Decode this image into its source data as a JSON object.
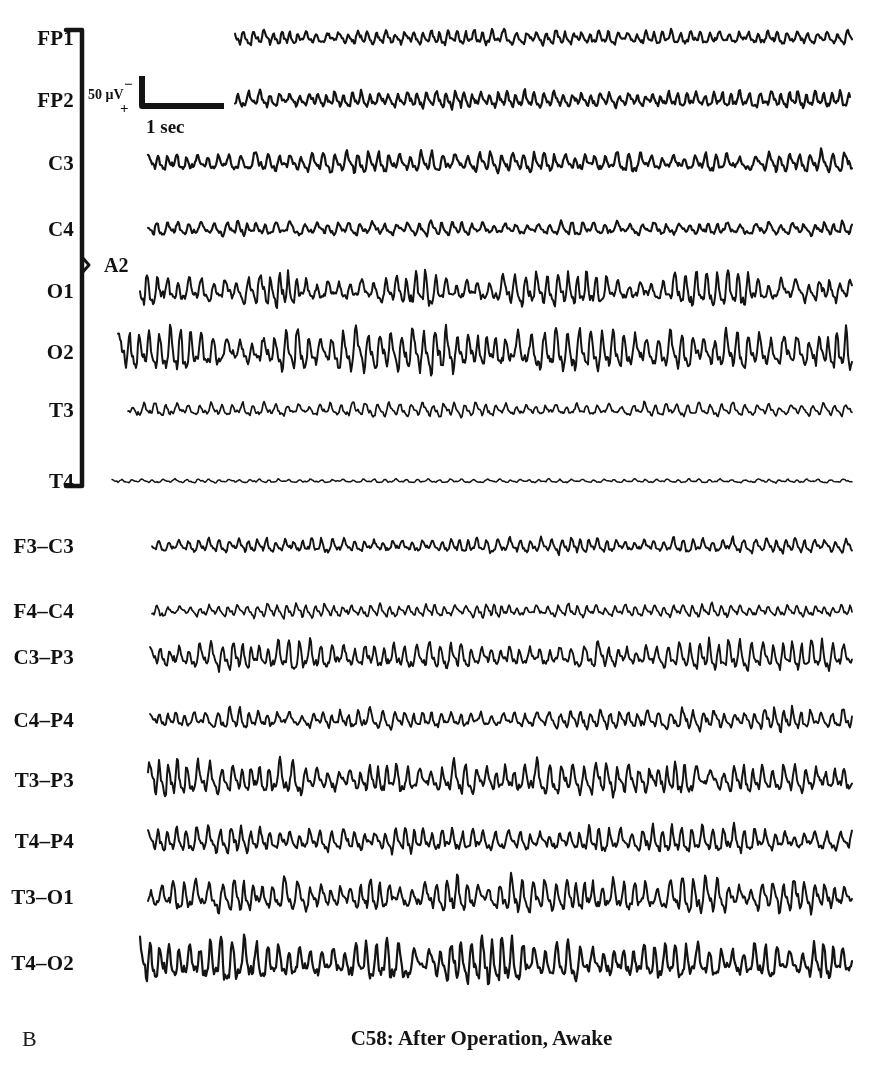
{
  "figure": {
    "panel_letter": "B",
    "caption": "C58: After Operation, Awake",
    "background_color": "#ffffff",
    "trace_color": "#141414"
  },
  "calibration": {
    "amplitude_label": "50 μV",
    "polarity_negative": "−",
    "polarity_positive": "+",
    "time_label": "1 sec",
    "amplitude_value": 50,
    "amplitude_units": "μV",
    "time_value": 1,
    "time_units": "sec"
  },
  "reference": {
    "label": "A2",
    "bracket_top_channel": "FP1",
    "bracket_bottom_channel": "T4"
  },
  "montages": [
    {
      "name": "referential",
      "reference": "A2",
      "channels": [
        {
          "label": "FP1",
          "y": 38,
          "x_start": 235,
          "x_end": 852,
          "amplitude": 7.5,
          "base_freq": 10.5,
          "seed": 11,
          "burst": 0.28,
          "thickness": 2.1
        },
        {
          "label": "FP2",
          "y": 100,
          "x_start": 235,
          "x_end": 850,
          "amplitude": 8.0,
          "base_freq": 10.8,
          "seed": 23,
          "burst": 0.3,
          "thickness": 2.2
        },
        {
          "label": "C3",
          "y": 163,
          "x_start": 148,
          "x_end": 852,
          "amplitude": 9.0,
          "base_freq": 10.2,
          "seed": 37,
          "burst": 0.4,
          "thickness": 2.2
        },
        {
          "label": "C4",
          "y": 229,
          "x_start": 148,
          "x_end": 852,
          "amplitude": 7.0,
          "base_freq": 10.0,
          "seed": 41,
          "burst": 0.34,
          "thickness": 2.1
        },
        {
          "label": "O1",
          "y": 291,
          "x_start": 140,
          "x_end": 852,
          "amplitude": 12.0,
          "base_freq": 10.6,
          "seed": 59,
          "burst": 0.62,
          "thickness": 2.0
        },
        {
          "label": "O2",
          "y": 352,
          "x_start": 118,
          "x_end": 852,
          "amplitude": 14.0,
          "base_freq": 10.4,
          "seed": 67,
          "burst": 0.7,
          "thickness": 2.0
        },
        {
          "label": "T3",
          "y": 410,
          "x_start": 128,
          "x_end": 852,
          "amplitude": 6.5,
          "base_freq": 10.7,
          "seed": 73,
          "burst": 0.3,
          "thickness": 1.7
        },
        {
          "label": "T4",
          "y": 481,
          "x_start": 112,
          "x_end": 852,
          "amplitude": 2.2,
          "base_freq": 11.0,
          "seed": 83,
          "burst": 0.16,
          "thickness": 1.5
        }
      ]
    },
    {
      "name": "bipolar",
      "reference": "",
      "channels": [
        {
          "label": "F3–C3",
          "y": 546,
          "x_start": 152,
          "x_end": 852,
          "amplitude": 7.0,
          "base_freq": 11.5,
          "seed": 97,
          "burst": 0.34,
          "thickness": 1.9
        },
        {
          "label": "F4–C4",
          "y": 611,
          "x_start": 152,
          "x_end": 852,
          "amplitude": 6.5,
          "base_freq": 11.8,
          "seed": 103,
          "burst": 0.32,
          "thickness": 1.7
        },
        {
          "label": "C3–P3",
          "y": 657,
          "x_start": 150,
          "x_end": 852,
          "amplitude": 11.0,
          "base_freq": 10.8,
          "seed": 109,
          "burst": 0.58,
          "thickness": 1.9
        },
        {
          "label": "C4–P4",
          "y": 720,
          "x_start": 150,
          "x_end": 852,
          "amplitude": 9.0,
          "base_freq": 11.0,
          "seed": 127,
          "burst": 0.42,
          "thickness": 1.9
        },
        {
          "label": "T3–P3",
          "y": 780,
          "x_start": 148,
          "x_end": 852,
          "amplitude": 12.5,
          "base_freq": 10.6,
          "seed": 131,
          "burst": 0.6,
          "thickness": 2.0
        },
        {
          "label": "T4–P4",
          "y": 841,
          "x_start": 148,
          "x_end": 852,
          "amplitude": 10.0,
          "base_freq": 10.9,
          "seed": 149,
          "burst": 0.48,
          "thickness": 2.0
        },
        {
          "label": "T3–O1",
          "y": 897,
          "x_start": 148,
          "x_end": 852,
          "amplitude": 12.0,
          "base_freq": 10.5,
          "seed": 157,
          "burst": 0.62,
          "thickness": 2.0
        },
        {
          "label": "T4–O2",
          "y": 963,
          "x_start": 140,
          "x_end": 852,
          "amplitude": 14.0,
          "base_freq": 10.3,
          "seed": 163,
          "burst": 0.72,
          "thickness": 2.2
        }
      ]
    }
  ],
  "chart_data": {
    "type": "line",
    "title": "C58: After Operation, Awake",
    "subtitle": "B",
    "xlabel": "Time",
    "ylabel": "Channel",
    "grid": false,
    "legend": "none",
    "x_units": "sec",
    "y_units": "μV",
    "scale_bar": {
      "amplitude": 50,
      "amplitude_units": "μV",
      "time": 1,
      "time_units": "sec"
    },
    "categories": [
      "FP1",
      "FP2",
      "C3",
      "C4",
      "O1",
      "O2",
      "T3",
      "T4",
      "F3–C3",
      "F4–C4",
      "C3–P3",
      "C4–P4",
      "T3–P3",
      "T4–P4",
      "T3–O1",
      "T4–O2"
    ],
    "series": [
      {
        "name": "FP1",
        "montage": "referential",
        "reference": "A2",
        "peak_to_peak_uv": 20,
        "dominant_freq_hz": 10.5
      },
      {
        "name": "FP2",
        "montage": "referential",
        "reference": "A2",
        "peak_to_peak_uv": 22,
        "dominant_freq_hz": 10.8
      },
      {
        "name": "C3",
        "montage": "referential",
        "reference": "A2",
        "peak_to_peak_uv": 25,
        "dominant_freq_hz": 10.2
      },
      {
        "name": "C4",
        "montage": "referential",
        "reference": "A2",
        "peak_to_peak_uv": 19,
        "dominant_freq_hz": 10.0
      },
      {
        "name": "O1",
        "montage": "referential",
        "reference": "A2",
        "peak_to_peak_uv": 33,
        "dominant_freq_hz": 10.6
      },
      {
        "name": "O2",
        "montage": "referential",
        "reference": "A2",
        "peak_to_peak_uv": 39,
        "dominant_freq_hz": 10.4
      },
      {
        "name": "T3",
        "montage": "referential",
        "reference": "A2",
        "peak_to_peak_uv": 18,
        "dominant_freq_hz": 10.7
      },
      {
        "name": "T4",
        "montage": "referential",
        "reference": "A2",
        "peak_to_peak_uv": 6,
        "dominant_freq_hz": 11.0
      },
      {
        "name": "F3–C3",
        "montage": "bipolar",
        "reference": "",
        "peak_to_peak_uv": 19,
        "dominant_freq_hz": 11.5
      },
      {
        "name": "F4–C4",
        "montage": "bipolar",
        "reference": "",
        "peak_to_peak_uv": 18,
        "dominant_freq_hz": 11.8
      },
      {
        "name": "C3–P3",
        "montage": "bipolar",
        "reference": "",
        "peak_to_peak_uv": 30,
        "dominant_freq_hz": 10.8
      },
      {
        "name": "C4–P4",
        "montage": "bipolar",
        "reference": "",
        "peak_to_peak_uv": 25,
        "dominant_freq_hz": 11.0
      },
      {
        "name": "T3–P3",
        "montage": "bipolar",
        "reference": "",
        "peak_to_peak_uv": 34,
        "dominant_freq_hz": 10.6
      },
      {
        "name": "T4–P4",
        "montage": "bipolar",
        "reference": "",
        "peak_to_peak_uv": 28,
        "dominant_freq_hz": 10.9
      },
      {
        "name": "T3–O1",
        "montage": "bipolar",
        "reference": "",
        "peak_to_peak_uv": 33,
        "dominant_freq_hz": 10.5
      },
      {
        "name": "T4–O2",
        "montage": "bipolar",
        "reference": "",
        "peak_to_peak_uv": 39,
        "dominant_freq_hz": 10.3
      }
    ]
  },
  "layout": {
    "width": 873,
    "height": 1080,
    "bracket_x": 82,
    "bracket_top": 30,
    "bracket_bottom": 486,
    "bracket_tick": 16,
    "ref_label_x": 104,
    "ref_label_y": 265,
    "label_right_x": 74,
    "cal_amp_x": 88,
    "cal_amp_y": 88,
    "cal_minus_x": 124,
    "cal_minus_y": 77,
    "cal_plus_x": 120,
    "cal_plus_y": 101,
    "cal_time_x": 146,
    "cal_time_y": 117,
    "cal_vert_x": 142,
    "cal_vert_top": 76,
    "cal_vert_bottom": 106,
    "cal_horiz_x2": 224
  }
}
